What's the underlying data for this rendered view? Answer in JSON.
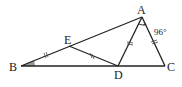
{
  "diagram": {
    "type": "triangle-geometry",
    "points": {
      "A": {
        "label": "A"
      },
      "B": {
        "label": "B"
      },
      "C": {
        "label": "C"
      },
      "D": {
        "label": "D"
      },
      "E": {
        "label": "E"
      }
    },
    "segments": [
      "AB",
      "BC",
      "CA",
      "AD",
      "ED"
    ],
    "equal_segments": [
      "BE",
      "ED",
      "DA",
      "AC"
    ],
    "angles": {
      "A_marked": {
        "vertex": "A",
        "between": [
          "D",
          "C"
        ],
        "label": "96°"
      },
      "B_shaded": {
        "vertex": "B",
        "label": ""
      }
    }
  }
}
